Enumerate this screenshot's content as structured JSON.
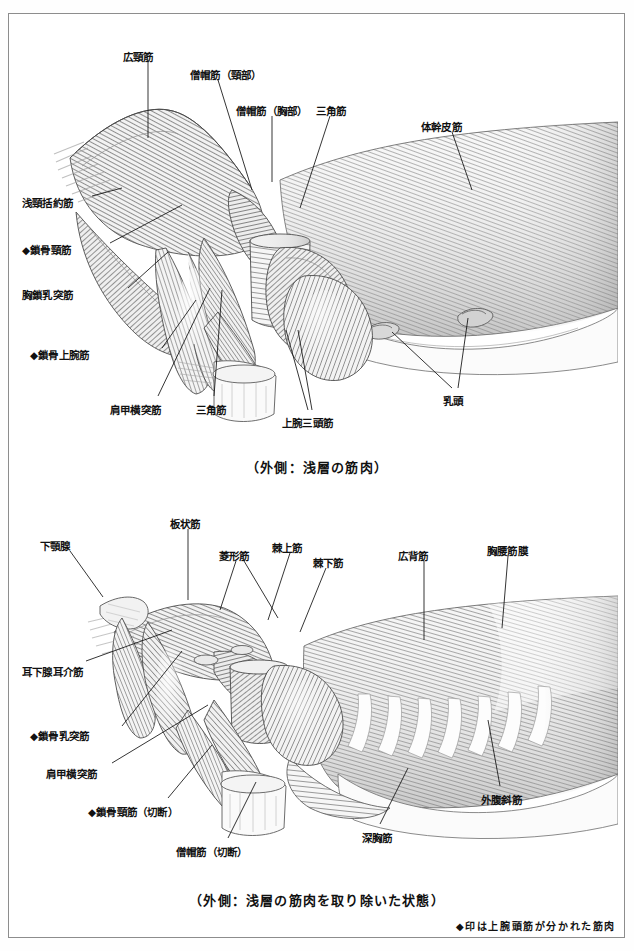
{
  "page": {
    "frame_color": "#8d8d8d",
    "ink_color": "#111111"
  },
  "footnote": {
    "text": "◆印は上腕頭筋が分かれた筋肉"
  },
  "panels": [
    {
      "id": "panel-superficial",
      "caption": "（外側：浅層の筋肉）",
      "labels": [
        {
          "id": "p1-l01",
          "text": "広頸筋",
          "x": 123,
          "y": 52,
          "anchor": "start",
          "leader": [
            [
              148,
              62
            ],
            [
              148,
              138
            ]
          ]
        },
        {
          "id": "p1-l02",
          "text": "僧帽筋（頸部）",
          "x": 190,
          "y": 70,
          "anchor": "start",
          "leader": [
            [
              218,
              80
            ],
            [
              252,
              190
            ]
          ]
        },
        {
          "id": "p1-l03",
          "text": "僧帽筋（胸部）",
          "x": 236,
          "y": 106,
          "anchor": "start",
          "leader": [
            [
              272,
              116
            ],
            [
              272,
              182
            ]
          ]
        },
        {
          "id": "p1-l04",
          "text": "三角筋",
          "x": 316,
          "y": 106,
          "anchor": "start",
          "leader": [
            [
              330,
              116
            ],
            [
              300,
              208
            ]
          ]
        },
        {
          "id": "p1-l05",
          "text": "体幹皮筋",
          "x": 421,
          "y": 122,
          "anchor": "start",
          "leader": [
            [
              452,
              132
            ],
            [
              472,
              190
            ]
          ]
        },
        {
          "id": "p1-l06",
          "text": "浅頸括約筋",
          "x": 22,
          "y": 198,
          "anchor": "start",
          "leader": [
            [
              92,
              196
            ],
            [
              122,
              188
            ]
          ]
        },
        {
          "id": "p1-l07",
          "text": "◆鎖骨頸筋",
          "x": 22,
          "y": 245,
          "anchor": "start",
          "leader": [
            [
              110,
              243
            ],
            [
              182,
              205
            ]
          ]
        },
        {
          "id": "p1-l08",
          "text": "胸鎖乳突筋",
          "x": 22,
          "y": 290,
          "anchor": "start",
          "leader": [
            [
              128,
              288
            ],
            [
              168,
              252
            ]
          ]
        },
        {
          "id": "p1-l09",
          "text": "◆鎖骨上腕筋",
          "x": 30,
          "y": 350,
          "anchor": "start",
          "leader": [
            [
              162,
              348
            ],
            [
              196,
              300
            ]
          ]
        },
        {
          "id": "p1-l10",
          "text": "肩甲横突筋",
          "x": 110,
          "y": 405,
          "anchor": "start",
          "leader": [
            [
              158,
              396
            ],
            [
              210,
              288
            ]
          ]
        },
        {
          "id": "p1-l11",
          "text": "三角筋",
          "x": 196,
          "y": 405,
          "anchor": "start",
          "leader": [
            [
              214,
              396
            ],
            [
              222,
              290
            ]
          ]
        },
        {
          "id": "p1-l12",
          "text": "上腕三頭筋",
          "x": 282,
          "y": 418,
          "anchor": "start",
          "leader": [
            [
              308,
              410
            ],
            [
              286,
              330
            ]
          ]
        },
        {
          "id": "p1-l13",
          "text": "上腕三頭筋-b",
          "x": -999,
          "y": -999,
          "anchor": "start",
          "leader": [
            [
              312,
              410
            ],
            [
              298,
              330
            ]
          ]
        },
        {
          "id": "p1-l14",
          "text": "乳頭",
          "x": 443,
          "y": 396,
          "anchor": "start",
          "leader": [
            [
              452,
              388
            ],
            [
              392,
              332
            ]
          ]
        },
        {
          "id": "p1-l15",
          "text": "乳頭-b",
          "x": -999,
          "y": -999,
          "anchor": "start",
          "leader": [
            [
              458,
              388
            ],
            [
              468,
              318
            ]
          ]
        }
      ]
    },
    {
      "id": "panel-deep",
      "caption": "（外側：浅層の筋肉を取り除いた状態）",
      "labels": [
        {
          "id": "p2-l01",
          "text": "板状筋",
          "x": 170,
          "y": 519,
          "anchor": "start",
          "leader": [
            [
              188,
              529
            ],
            [
              188,
              600
            ]
          ]
        },
        {
          "id": "p2-l02",
          "text": "菱形筋",
          "x": 219,
          "y": 551,
          "anchor": "start",
          "leader": [
            [
              236,
              561
            ],
            [
              220,
              610
            ]
          ]
        },
        {
          "id": "p2-l03",
          "text": "菱形筋-b",
          "x": -999,
          "y": -999,
          "anchor": "start",
          "leader": [
            [
              244,
              561
            ],
            [
              278,
              618
            ]
          ]
        },
        {
          "id": "p2-l04",
          "text": "棘上筋",
          "x": 272,
          "y": 543,
          "anchor": "start",
          "leader": [
            [
              290,
              553
            ],
            [
              268,
              620
            ]
          ]
        },
        {
          "id": "p2-l05",
          "text": "棘下筋",
          "x": 313,
          "y": 558,
          "anchor": "start",
          "leader": [
            [
              326,
              568
            ],
            [
              300,
              632
            ]
          ]
        },
        {
          "id": "p2-l06",
          "text": "広背筋",
          "x": 398,
          "y": 551,
          "anchor": "start",
          "leader": [
            [
              424,
              561
            ],
            [
              424,
              640
            ]
          ]
        },
        {
          "id": "p2-l07",
          "text": "胸腰筋膜",
          "x": 487,
          "y": 546,
          "anchor": "start",
          "leader": [
            [
              508,
              556
            ],
            [
              502,
              628
            ]
          ]
        },
        {
          "id": "p2-l08",
          "text": "下顎腺",
          "x": 40,
          "y": 541,
          "anchor": "start",
          "leader": [
            [
              70,
              551
            ],
            [
              103,
              597
            ]
          ]
        },
        {
          "id": "p2-l09",
          "text": "耳下腺耳介筋",
          "x": 22,
          "y": 667,
          "anchor": "start",
          "leader": [
            [
              86,
              661
            ],
            [
              172,
              630
            ]
          ]
        },
        {
          "id": "p2-l10",
          "text": "◆鎖骨乳突筋",
          "x": 30,
          "y": 731,
          "anchor": "start",
          "leader": [
            [
              122,
              726
            ],
            [
              182,
              651
            ]
          ]
        },
        {
          "id": "p2-l11",
          "text": "肩甲横突筋",
          "x": 46,
          "y": 769,
          "anchor": "start",
          "leader": [
            [
              112,
              763
            ],
            [
              208,
              705
            ]
          ]
        },
        {
          "id": "p2-l12",
          "text": "◆鎖骨頸筋（切断）",
          "x": 88,
          "y": 807,
          "anchor": "start",
          "leader": [
            [
              168,
              798
            ],
            [
              212,
              745
            ]
          ]
        },
        {
          "id": "p2-l13",
          "text": "僧帽筋（切断）",
          "x": 176,
          "y": 847,
          "anchor": "start",
          "leader": [
            [
              228,
              838
            ],
            [
              256,
              782
            ]
          ]
        },
        {
          "id": "p2-l14",
          "text": "深胸筋",
          "x": 362,
          "y": 833,
          "anchor": "start",
          "leader": [
            [
              380,
              824
            ],
            [
              408,
              768
            ]
          ]
        },
        {
          "id": "p2-l15",
          "text": "外腹斜筋",
          "x": 481,
          "y": 795,
          "anchor": "start",
          "leader": [
            [
              500,
              786
            ],
            [
              488,
              720
            ]
          ]
        }
      ]
    }
  ]
}
